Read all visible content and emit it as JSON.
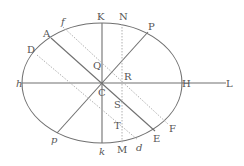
{
  "diagram": {
    "colors": {
      "background": "#ffffff",
      "solid_line": "#707070",
      "dotted_line": "#b0b0b0",
      "label": "#555555"
    },
    "ellipse": {
      "cx": 102,
      "cy": 83,
      "rx": 80,
      "ry": 60
    },
    "labels": {
      "K": "K",
      "N": "N",
      "P": "P",
      "f": "f",
      "A": "A",
      "D": "D",
      "h": "h",
      "Q": "Q",
      "R": "R",
      "C": "C",
      "H": "H",
      "L": "L",
      "S": "S",
      "T": "T",
      "p": "p",
      "k": "k",
      "M": "M",
      "d": "d",
      "E": "E",
      "F": "F"
    }
  }
}
